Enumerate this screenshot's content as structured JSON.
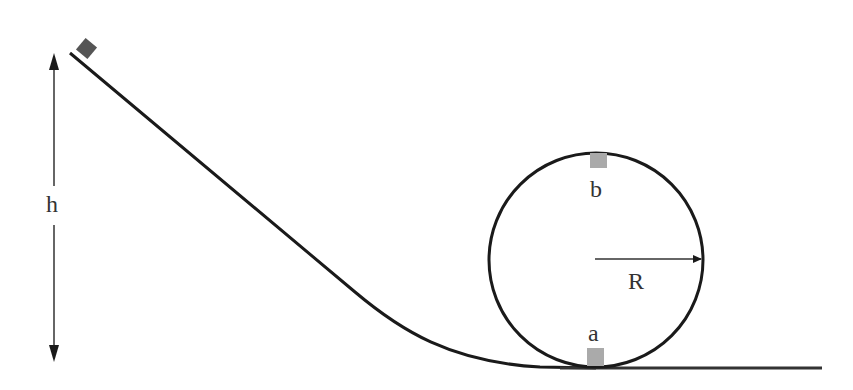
{
  "diagram": {
    "type": "loop-the-loop track",
    "labels": {
      "height": "h",
      "radius": "R",
      "point_top": "b",
      "point_bottom": "a"
    },
    "colors": {
      "stroke": "#1a1a1a",
      "block_start": "#555555",
      "block_loop": "#aaaaaa",
      "background": "#ffffff"
    },
    "elements": [
      {
        "name": "height-arrow",
        "description": "double-headed vertical arrow indicating height h"
      },
      {
        "name": "incline-track",
        "description": "sloped track curving to horizontal"
      },
      {
        "name": "start-block",
        "description": "dark block at top of incline"
      },
      {
        "name": "loop",
        "description": "circular loop of radius R"
      },
      {
        "name": "block-b",
        "description": "block at top of loop, point b"
      },
      {
        "name": "block-a",
        "description": "block at bottom of loop, point a"
      },
      {
        "name": "radius-arrow",
        "description": "arrow from loop center to rim labeled R"
      },
      {
        "name": "ground-track",
        "description": "horizontal track after loop"
      }
    ]
  }
}
